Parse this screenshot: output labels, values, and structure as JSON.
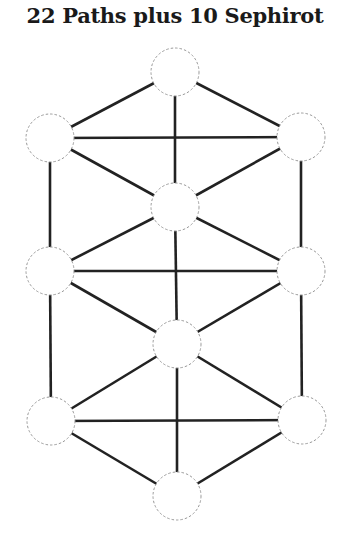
{
  "title": "22 Paths plus 10 Sephirot",
  "diagram": {
    "node_radius": 24,
    "nodes": [
      {
        "id": "n1",
        "x": 175,
        "y": 72
      },
      {
        "id": "n2",
        "x": 50,
        "y": 138
      },
      {
        "id": "n3",
        "x": 301,
        "y": 137
      },
      {
        "id": "n4",
        "x": 175,
        "y": 207
      },
      {
        "id": "n5",
        "x": 50,
        "y": 271
      },
      {
        "id": "n6",
        "x": 301,
        "y": 271
      },
      {
        "id": "n7",
        "x": 177,
        "y": 344
      },
      {
        "id": "n8",
        "x": 51,
        "y": 421
      },
      {
        "id": "n9",
        "x": 302,
        "y": 420
      },
      {
        "id": "n10",
        "x": 177,
        "y": 496
      }
    ],
    "edges": [
      [
        "n1",
        "n2"
      ],
      [
        "n1",
        "n3"
      ],
      [
        "n1",
        "n4"
      ],
      [
        "n2",
        "n3"
      ],
      [
        "n2",
        "n4"
      ],
      [
        "n3",
        "n4"
      ],
      [
        "n2",
        "n5"
      ],
      [
        "n3",
        "n6"
      ],
      [
        "n5",
        "n4"
      ],
      [
        "n6",
        "n4"
      ],
      [
        "n5",
        "n6"
      ],
      [
        "n4",
        "n7"
      ],
      [
        "n5",
        "n7"
      ],
      [
        "n6",
        "n7"
      ],
      [
        "n5",
        "n8"
      ],
      [
        "n6",
        "n9"
      ],
      [
        "n7",
        "n8"
      ],
      [
        "n7",
        "n9"
      ],
      [
        "n8",
        "n9"
      ],
      [
        "n7",
        "n10"
      ],
      [
        "n8",
        "n10"
      ],
      [
        "n9",
        "n10"
      ]
    ],
    "colors": {
      "edge": "#222222",
      "node_stroke": "#999999",
      "node_fill": "#ffffff"
    }
  }
}
